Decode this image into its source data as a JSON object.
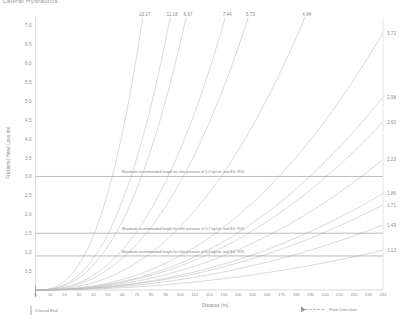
{
  "title": "Lateral Hydraulics",
  "axes": {
    "ylabel": "Frictional Head Loss (m)",
    "xlabel": "Distance (m)",
    "yticks": [
      "7.0",
      "6.5",
      "6.0",
      "5.5",
      "5.0",
      "4.5",
      "4.0",
      "3.5",
      "3.0",
      "2.5",
      "2.0",
      "1.5",
      "1.0",
      "0.5"
    ],
    "xticks": [
      "0",
      "10",
      "20",
      "30",
      "40",
      "50",
      "60",
      "70",
      "80",
      "90",
      "100",
      "110",
      "120",
      "130",
      "140",
      "150",
      "160",
      "170",
      "180",
      "190",
      "200",
      "210",
      "220",
      "230",
      "240"
    ]
  },
  "annotations": [
    {
      "text": "Maximum recommended length for inlet pressure of 1.0 kg/cm² and EU: 90%",
      "value": 3.0
    },
    {
      "text": "Maximum recommended length for inlet pressure of 0.7 kg/cm² and EU: 90%",
      "value": 1.5
    },
    {
      "text": "Maximum recommended length for inlet pressure of 0.4 kg/cm² and EU: 90%",
      "value": 0.9
    }
  ],
  "markers": {
    "closed_end": "Closed End",
    "flow_direction": "Flow Direction"
  },
  "colors": {
    "curve": "#b9b9b9",
    "reference_line": "#8f8f8f",
    "axis": "#c9c9c9",
    "text": "#8d8d8d"
  },
  "chart_data": {
    "type": "line",
    "title": "Lateral Hydraulics",
    "xlabel": "Distance (m)",
    "ylabel": "Frictional Head Loss (m)",
    "xlim": [
      0,
      240
    ],
    "ylim": [
      0,
      7.2
    ],
    "grid": false,
    "legend_position": "bottom-right",
    "reference_lines": [
      {
        "y": 3.0,
        "label": "Maximum recommended length for inlet pressure of 1.0 kg/cm² and EU: 90%"
      },
      {
        "y": 1.5,
        "label": "Maximum recommended length for inlet pressure of 0.7 kg/cm² and EU: 90%"
      },
      {
        "y": 0.9,
        "label": "Maximum recommended length for inlet pressure of 0.4 kg/cm² and EU: 90%"
      }
    ],
    "series": [
      {
        "name": "13.17",
        "end_label": "13.17",
        "label_position": "top",
        "exponent": 2.62,
        "x_end": 74,
        "y_end": 7.2
      },
      {
        "name": "11.18",
        "end_label": "11.18",
        "label_position": "top",
        "exponent": 2.55,
        "x_end": 93,
        "y_end": 7.2
      },
      {
        "name": "6.67",
        "end_label": "6.67",
        "label_position": "top",
        "exponent": 2.5,
        "x_end": 104,
        "y_end": 7.2
      },
      {
        "name": "7.44",
        "end_label": "7.44",
        "label_position": "top",
        "exponent": 2.45,
        "x_end": 131,
        "y_end": 7.2
      },
      {
        "name": "5.73",
        "end_label": "5.73",
        "label_position": "top",
        "exponent": 2.4,
        "x_end": 147,
        "y_end": 7.2
      },
      {
        "name": "4.84",
        "end_label": "4.84",
        "label_position": "top",
        "exponent": 2.35,
        "x_end": 186,
        "y_end": 7.2
      },
      {
        "name": "3.72",
        "end_label": "3.72",
        "label_position": "right",
        "exponent": 2.3,
        "x_end": 240,
        "y_end": 6.8
      },
      {
        "name": "2.98",
        "end_label": "2.98",
        "label_position": "right",
        "exponent": 2.25,
        "x_end": 240,
        "y_end": 5.1
      },
      {
        "name": "2.60",
        "end_label": "2.60",
        "label_position": "right",
        "exponent": 2.22,
        "x_end": 240,
        "y_end": 4.45
      },
      {
        "name": "2.23",
        "end_label": "2.23",
        "label_position": "right",
        "exponent": 2.18,
        "x_end": 240,
        "y_end": 3.45
      },
      {
        "name": "1.86",
        "end_label": "1.86",
        "label_position": "right",
        "exponent": 2.14,
        "x_end": 240,
        "y_end": 2.55
      },
      {
        "name": "1.71",
        "end_label": "1.71",
        "label_position": "right",
        "exponent": 2.12,
        "x_end": 240,
        "y_end": 2.25
      },
      {
        "name": "1.49",
        "end_label": "1.49",
        "label_position": "right",
        "exponent": 2.09,
        "x_end": 240,
        "y_end": 1.72
      },
      {
        "name": "1.12",
        "end_label": "1.12",
        "label_position": "right",
        "exponent": 2.05,
        "x_end": 240,
        "y_end": 1.05
      }
    ]
  }
}
